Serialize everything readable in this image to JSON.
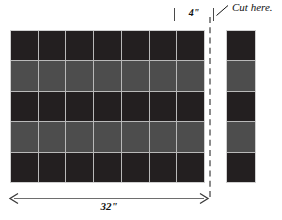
{
  "diagram": {
    "annotations": {
      "cut_label": "Cut here.",
      "width_label": "32\"",
      "strip_width_label": "4\""
    },
    "colors": {
      "dark_tile": "#231f20",
      "light_tile": "#4d4d4d",
      "grout": "#b9b9b9",
      "border": "#cfcfcf",
      "cut_line": "#8a8a8a",
      "ink": "#111111"
    },
    "main_grid": {
      "columns": 7,
      "rows": 5,
      "row_shades": [
        "dark",
        "light",
        "dark",
        "light",
        "dark"
      ]
    },
    "cut_strip": {
      "columns": 1,
      "rows": 5,
      "row_shades": [
        "dark",
        "light",
        "dark",
        "light",
        "dark"
      ]
    }
  }
}
